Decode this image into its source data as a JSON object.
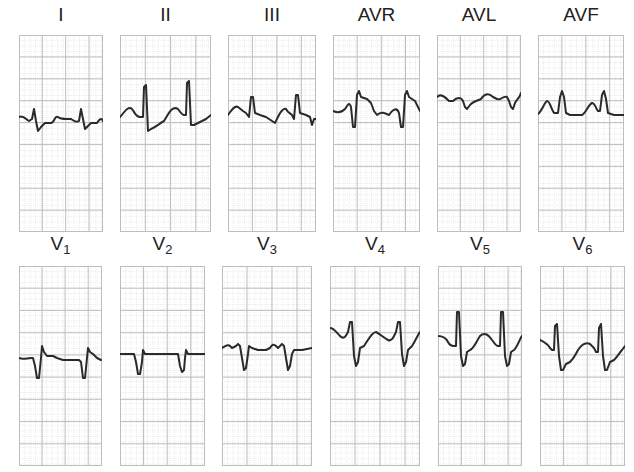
{
  "figure": {
    "grid": {
      "minor_color": "#d9d9d9",
      "major_color": "#bdbdbd",
      "trace_color": "#2a2a2a",
      "background": "#ffffff"
    },
    "rows": [
      {
        "leads": [
          {
            "id": "I",
            "label": "I",
            "sub": "",
            "x": 19,
            "w": 84,
            "top": 35,
            "h": 197,
            "trace": "M0,82 C4,80 7,84 10,86 L13,84 L15,74 L17,86 L19,96 L22,92 L26,88 L32,88 C35,88 36,80 39,82 C41,84 44,84 48,84 L52,84 C55,86 57,88 60,86 L62,74 L64,84 L66,94 L68,92 L72,88 L78,88 C80,85 82,82 84,86"
          },
          {
            "id": "II",
            "label": "II",
            "sub": "",
            "x": 120,
            "w": 91,
            "top": 35,
            "h": 197,
            "trace": "M0,82 C4,78 8,70 12,74 C15,78 16,82 20,82 L23,82 L24,52 L26,50 L28,96 L31,94 C36,92 40,88 44,86 C48,80 52,70 58,74 C61,78 62,80 64,80 L66,80 L67,48 L69,46 L71,90 L74,90 C78,88 82,86 86,84 L91,80"
          },
          {
            "id": "III",
            "label": "III",
            "sub": "",
            "x": 228,
            "w": 88,
            "top": 35,
            "h": 197,
            "trace": "M0,80 C3,76 6,70 10,72 L15,76 L18,78 L21,82 L23,62 L25,62 L27,78 L32,80 L38,82 L44,86 L47,88 C50,82 54,72 58,74 C60,78 62,78 64,80 L66,84 L68,60 L70,60 L72,78 L78,80 L82,82 L84,90 L86,84 L88,84"
          },
          {
            "id": "AVR",
            "label": "AVR",
            "sub": "",
            "x": 333,
            "w": 87,
            "top": 35,
            "h": 197,
            "trace": "M0,76 C4,78 8,78 12,74 C15,70 16,66 18,72 L20,92 L22,92 L24,60 L26,56 L28,62 L34,64 L38,68 L41,76 L44,80 C48,76 52,78 56,80 C60,74 64,72 66,78 L68,92 L70,92 L72,60 L74,56 L76,62 L82,66 L85,72 L87,76"
          },
          {
            "id": "AVL",
            "label": "AVL",
            "sub": "",
            "x": 437,
            "w": 84,
            "top": 35,
            "h": 197,
            "trace": "M0,62 C4,58 8,62 12,66 L16,66 C20,62 24,62 26,66 L28,72 L30,74 L33,70 C36,66 40,66 44,64 C48,58 52,58 56,62 L60,64 C64,66 66,60 70,62 L72,66 L74,72 L76,74 L78,68 C80,64 82,64 84,58"
          },
          {
            "id": "AVF",
            "label": "AVF",
            "sub": "",
            "x": 538,
            "w": 86,
            "top": 35,
            "h": 197,
            "trace": "M0,79 C4,76 6,68 9,66 C12,66 13,74 16,78 L20,78 L22,62 L24,56 L26,62 L28,78 L32,80 L38,80 L44,80 C48,78 50,70 54,68 C57,68 58,74 60,76 L62,76 L64,60 L66,56 L68,64 L70,78 L76,80 L82,80 L86,80"
          }
        ]
      },
      {
        "leads": [
          {
            "id": "V1",
            "label": "V",
            "sub": "1",
            "x": 19,
            "w": 83,
            "top": 266,
            "h": 200,
            "trace": "M0,92 C4,94 8,92 12,92 L14,92 L16,100 L18,112 L20,112 L22,92 L23,80 L25,86 L28,90 L34,90 L38,92 L44,94 L50,94 L56,94 L60,94 L62,96 L64,112 L66,112 L68,92 L69,82 L71,86 L74,88 L78,92 L82,94"
          },
          {
            "id": "V2",
            "label": "V",
            "sub": "2",
            "x": 120,
            "w": 85,
            "top": 266,
            "h": 200,
            "trace": "M0,88 L10,88 L14,88 L16,96 L18,108 L20,108 L22,96 L23,84 L25,88 L30,88 L40,88 L50,88 L56,88 L58,88 L60,100 L62,106 L64,104 L65,92 L66,84 L68,88 L76,88 L85,88"
          },
          {
            "id": "V3",
            "label": "V",
            "sub": "3",
            "x": 222,
            "w": 90,
            "top": 266,
            "h": 200,
            "trace": "M0,82 C4,80 6,78 8,80 L10,82 L14,80 L16,78 L18,80 L20,92 L22,104 L24,102 L26,88 L27,80 L30,82 L36,84 L44,84 L48,82 C50,78 52,78 54,80 L56,82 L58,80 L60,78 L62,80 L64,92 L66,104 L68,100 L70,88 L72,84 L80,84 L90,82"
          },
          {
            "id": "V4",
            "label": "V",
            "sub": "4",
            "x": 330,
            "w": 90,
            "top": 266,
            "h": 200,
            "trace": "M0,62 C4,62 6,66 10,70 C14,74 16,70 18,66 L20,56 L22,56 L24,90 L26,100 L28,96 L30,82 L34,80 C38,74 42,66 46,66 C50,68 54,72 58,74 C62,76 64,70 66,66 L68,56 L70,56 L72,88 L74,100 L76,96 L78,84 L82,80 C86,74 88,68 90,66"
          },
          {
            "id": "V5",
            "label": "V",
            "sub": "5",
            "x": 438,
            "w": 84,
            "top": 266,
            "h": 200,
            "trace": "M0,70 C4,70 8,72 10,76 C12,80 14,80 16,80 L18,80 L19,46 L21,46 L23,90 L25,100 L27,98 L29,86 L32,84 C36,82 38,76 42,70 C46,66 50,68 54,74 C57,78 58,80 60,80 L62,80 L63,46 L65,46 L67,90 L69,100 L71,98 L73,86 L76,84 C80,80 82,72 84,70"
          },
          {
            "id": "V6",
            "label": "V",
            "sub": "6",
            "x": 540,
            "w": 85,
            "top": 266,
            "h": 200,
            "trace": "M0,74 C4,76 8,78 10,82 L12,84 L14,84 L15,60 L17,58 L19,90 L21,104 L23,104 L26,98 L30,96 C34,92 36,88 38,84 C42,78 46,76 50,78 L54,82 L56,86 L58,86 L59,62 L61,58 L63,90 L65,104 L67,104 L70,96 L74,94 C78,90 80,86 82,84 L85,80"
          }
        ]
      }
    ]
  }
}
